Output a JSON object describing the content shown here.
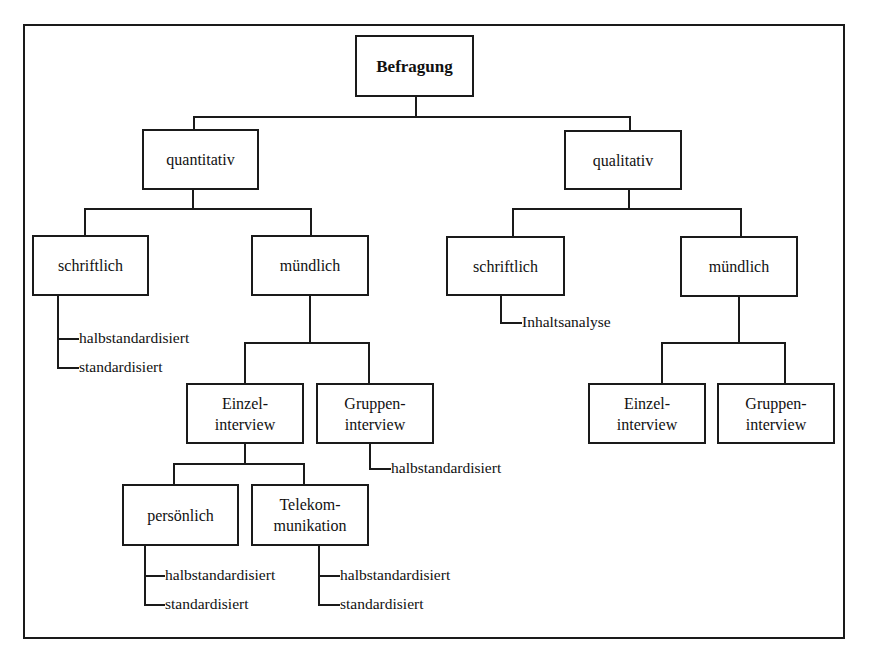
{
  "diagram": {
    "type": "tree",
    "root": {
      "label": "Befragung",
      "children": [
        {
          "label": "quantitativ",
          "children": [
            {
              "label": "schriftlich",
              "leaves": [
                "halbstandardisiert",
                "standardisiert"
              ]
            },
            {
              "label": "mündlich",
              "children": [
                {
                  "label": "Einzel-\ninterview",
                  "children": [
                    {
                      "label": "persönlich",
                      "leaves": [
                        "halbstandardisiert",
                        "standardisiert"
                      ]
                    },
                    {
                      "label": "Telekom-\nmunikation",
                      "leaves": [
                        "halbstandardisiert",
                        "standardisiert"
                      ]
                    }
                  ]
                },
                {
                  "label": "Gruppen-\ninterview",
                  "leaves": [
                    "halbstandardisiert"
                  ]
                }
              ]
            }
          ]
        },
        {
          "label": "qualitativ",
          "children": [
            {
              "label": "schriftlich",
              "leaves": [
                "Inhaltsanalyse"
              ]
            },
            {
              "label": "mündlich",
              "children": [
                {
                  "label": "Einzel-\ninterview"
                },
                {
                  "label": "Gruppen-\ninterview"
                }
              ]
            }
          ]
        }
      ]
    }
  },
  "nodes": {
    "root": "Befragung",
    "quant": "quantitativ",
    "qual": "qualitativ",
    "quant_schrift": "schriftlich",
    "quant_muend": "mündlich",
    "qual_schrift": "schriftlich",
    "qual_muend": "mündlich",
    "quant_einzel": "Einzel-\ninterview",
    "quant_gruppen": "Gruppen-\ninterview",
    "persoenlich": "persönlich",
    "telekom": "Telekom-\nmunikation",
    "qual_einzel": "Einzel-\ninterview",
    "qual_gruppen": "Gruppen-\ninterview"
  },
  "leaves": {
    "quant_schrift_1": "halbstandardisiert",
    "quant_schrift_2": "standardisiert",
    "gruppen_1": "halbstandardisiert",
    "persoenlich_1": "halbstandardisiert",
    "persoenlich_2": "standardisiert",
    "telekom_1": "halbstandardisiert",
    "telekom_2": "standardisiert",
    "qual_schrift_1": "Inhaltsanalyse"
  }
}
